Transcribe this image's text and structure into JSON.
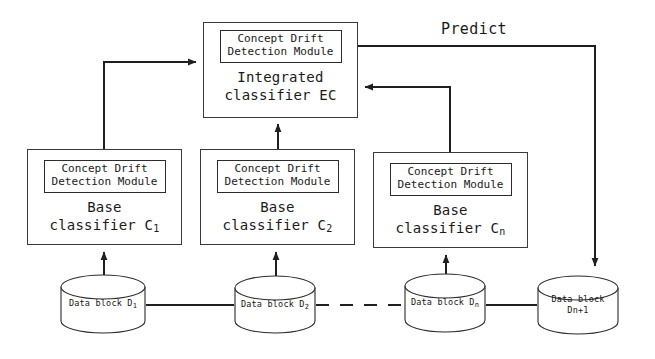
{
  "diagram": {
    "stroke_color": "#3a3a3a",
    "background_color": "#ffffff"
  },
  "module_label": {
    "line1": "Concept Drift",
    "line2": "Detection Module"
  },
  "integrated": {
    "module_line1": "Concept Drift",
    "module_line2": "Detection Module",
    "caption_line1": "Integrated",
    "caption_line2": "classifier EC"
  },
  "base_classifiers": [
    {
      "id": "c1",
      "module_line1": "Concept Drift",
      "module_line2": "Detection Module",
      "caption_line1": "Base",
      "caption_line2": "classifier C",
      "subscript": "1"
    },
    {
      "id": "c2",
      "module_line1": "Concept Drift",
      "module_line2": "Detection Module",
      "caption_line1": "Base",
      "caption_line2": "classifier C",
      "subscript": "2"
    },
    {
      "id": "cn",
      "module_line1": "Concept Drift",
      "module_line2": "Detection Module",
      "caption_line1": "Base",
      "caption_line2": "classifier C",
      "subscript": "n"
    }
  ],
  "data_blocks": [
    {
      "id": "d1",
      "line1": "Data block D",
      "subscript": "1",
      "line2": ""
    },
    {
      "id": "d2",
      "line1": "Data block D",
      "subscript": "2",
      "line2": ""
    },
    {
      "id": "dn",
      "line1": "Data block D",
      "subscript": "n",
      "line2": ""
    },
    {
      "id": "dn1",
      "line1": "Data block",
      "subscript": "",
      "line2": "Dn+1"
    }
  ],
  "edges": {
    "predict_label": "Predict"
  }
}
